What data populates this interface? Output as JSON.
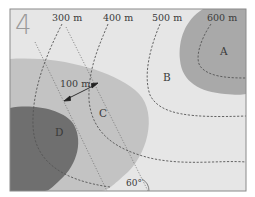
{
  "figure": {
    "number_label": "4",
    "contours": [
      {
        "label": "300 m"
      },
      {
        "label": "400 m"
      },
      {
        "label": "500 m"
      },
      {
        "label": "600 m"
      }
    ],
    "regions": [
      {
        "label": "A"
      },
      {
        "label": "B"
      },
      {
        "label": "C"
      },
      {
        "label": "D"
      }
    ],
    "distance_marker": {
      "label": "100 m"
    },
    "angle_marker": {
      "label": "60°"
    },
    "colors": {
      "background": "#e6e6e6",
      "light_zone": "#c3c3c3",
      "mid_zone": "#a9a9a9",
      "dark_zone": "#6f6f6f",
      "border": "#8a8a8a",
      "contour_line": "#555555",
      "straight_line": "#777777"
    }
  }
}
